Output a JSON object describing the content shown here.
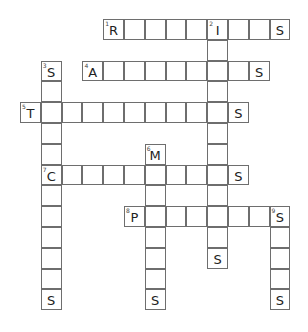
{
  "puzzle": {
    "type": "crossword",
    "grid_origin": {
      "x": 20,
      "y": 19
    },
    "cell_size": 20.8,
    "border_color": "#6e6e6e",
    "entries": [
      {
        "number": "1",
        "direction": "across",
        "row": 0,
        "col": 4,
        "length": 9,
        "given": {
          "0": "R",
          "5": "I",
          "8": "S"
        }
      },
      {
        "number": "2",
        "direction": "down",
        "row": 0,
        "col": 9,
        "length": 12,
        "given": {
          "0": "I",
          "11": "S"
        }
      },
      {
        "number": "3",
        "direction": "down",
        "row": 2,
        "col": 1,
        "length": 12,
        "given": {
          "0": "S",
          "11": "S"
        }
      },
      {
        "number": "4",
        "direction": "across",
        "row": 2,
        "col": 3,
        "length": 9,
        "given": {
          "0": "A",
          "8": "S"
        }
      },
      {
        "number": "5",
        "direction": "across",
        "row": 4,
        "col": 0,
        "length": 11,
        "given": {
          "0": "T",
          "10": "S"
        }
      },
      {
        "number": "6",
        "direction": "down",
        "row": 6,
        "col": 6,
        "length": 8,
        "given": {
          "0": "M",
          "7": "S"
        }
      },
      {
        "number": "7",
        "direction": "across",
        "row": 7,
        "col": 1,
        "length": 10,
        "given": {
          "0": "C",
          "9": "S"
        }
      },
      {
        "number": "8",
        "direction": "across",
        "row": 9,
        "col": 5,
        "length": 8,
        "given": {
          "0": "P",
          "7": "S"
        }
      },
      {
        "number": "9",
        "direction": "down",
        "row": 9,
        "col": 12,
        "length": 5,
        "given": {
          "0": "S",
          "4": "S"
        }
      }
    ]
  }
}
